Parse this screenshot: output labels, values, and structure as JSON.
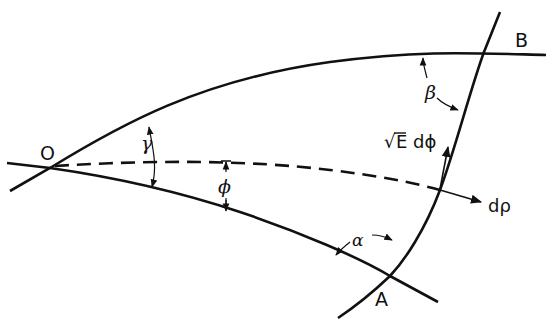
{
  "diagram": {
    "type": "geodesic-triangle",
    "colors": {
      "stroke": "#111111",
      "background": "#ffffff"
    },
    "points": [
      {
        "id": "O",
        "label": "O"
      },
      {
        "id": "A",
        "label": "A"
      },
      {
        "id": "B",
        "label": "B"
      }
    ],
    "angles": {
      "alpha": "α",
      "beta": "β",
      "gamma": "γ",
      "phi": "ϕ"
    },
    "vectors": {
      "radial": "dρ",
      "tangential_sqrt": "√",
      "tangential_rest": "E dϕ"
    },
    "curves": [
      {
        "id": "OB",
        "style": "solid"
      },
      {
        "id": "OA",
        "style": "solid"
      },
      {
        "id": "AB",
        "style": "solid"
      },
      {
        "id": "geodesic-phi",
        "style": "dashed"
      }
    ]
  }
}
